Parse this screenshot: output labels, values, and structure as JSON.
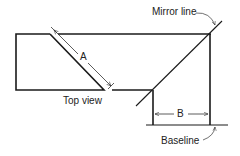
{
  "diagram": {
    "labels": {
      "mirror_line": "Mirror line",
      "top_view": "Top view",
      "baseline": "Baseline",
      "dim_a": "A",
      "dim_b": "B"
    },
    "colors": {
      "stroke": "#1a1a1a",
      "thin": "#333333",
      "background": "#ffffff"
    }
  }
}
